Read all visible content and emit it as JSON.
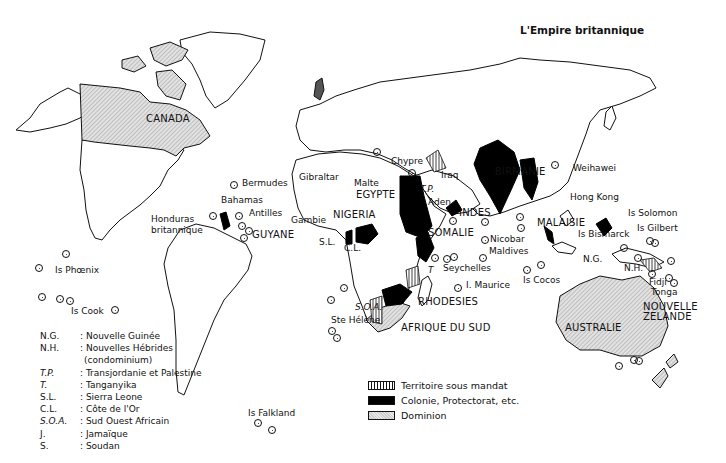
{
  "title": "L'Empire britannique",
  "colors": {
    "mandat": "#111111",
    "colonie": "#000000",
    "dominion": "#d4d4d4",
    "outline": "#111111"
  },
  "legend": {
    "items": [
      {
        "key": "mandat",
        "label": "Territoire sous mandat"
      },
      {
        "key": "colonie",
        "label": "Colonie, Protectorat, etc."
      },
      {
        "key": "dominion",
        "label": "Dominion"
      }
    ]
  },
  "abbreviations": [
    {
      "abbr": "N.G.",
      "meaning": ": Nouvelle Guinée",
      "italic": false
    },
    {
      "abbr": "N.H.",
      "meaning": ": Nouvelles Hébrides",
      "italic": false
    },
    {
      "abbr": "",
      "meaning": "(condominium)",
      "italic": false
    },
    {
      "abbr": "T.P.",
      "meaning": ": Transjordanie et Palestine",
      "italic": true
    },
    {
      "abbr": "T.",
      "meaning": ": Tanganyika",
      "italic": true
    },
    {
      "abbr": "S.L.",
      "meaning": ": Sierra Leone",
      "italic": false
    },
    {
      "abbr": "C.L.",
      "meaning": ": Côte de l'Or",
      "italic": false
    },
    {
      "abbr": "S.O.A.",
      "meaning": ": Sud Ouest Africain",
      "italic": true
    },
    {
      "abbr": "J.",
      "meaning": ": Jamaïque",
      "italic": false
    },
    {
      "abbr": "S.",
      "meaning": ": Soudan",
      "italic": false
    }
  ],
  "labels": {
    "canada": "CANADA",
    "bermudes": "Bermudes",
    "bahamas": "Bahamas",
    "antilles": "Antilles",
    "honduras1": "Honduras",
    "honduras2": "britannique",
    "guyane": "GUYANE",
    "phoenix": "Is Phœnix",
    "cook": "Is Cook",
    "falkland": "Is Falkland",
    "gibraltar": "Gibraltar",
    "malte": "Malte",
    "chypre": "Chypre",
    "egypte": "EGYPTE",
    "iraq": "Iraq",
    "tp": "T.P.",
    "aden": "Aden",
    "gambie": "Gambie",
    "nigeria": "NIGERIA",
    "sl": "S.L.",
    "cl": "C.L.",
    "somalie": "SOMALIE",
    "indes": "INDES",
    "birmanie": "BIRMANIE",
    "t": "T",
    "seychelles": "Seychelles",
    "sthelene": "Ste Hélène",
    "maurice": "I. Maurice",
    "soa": "S.O.A.",
    "rhodesies": "RHODESIES",
    "afriquesud": "AFRIQUE DU SUD",
    "nicobar": "Nicobar",
    "maldives": "Maldives",
    "malaisie": "MALAISIE",
    "cocos": "Is Cocos",
    "weihawei": "Weihawei",
    "hongkong": "Hong Kong",
    "solomon": "Is Solomon",
    "gilbert": "Is Gilbert",
    "bismarck": "Is Bismarck",
    "ng": "N.G.",
    "nh": "N.H.",
    "fidji": "Fidji",
    "tonga": "Tonga",
    "australie": "AUSTRALIE",
    "nz1": "NOUVELLE",
    "nz2": "ZELANDE"
  }
}
